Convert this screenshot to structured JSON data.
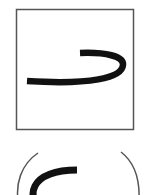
{
  "options": [
    {
      "shape": "square-frame",
      "glyph": "curved-stroke-hook-right",
      "stroke_color": "#111111",
      "frame_color": "#555555"
    },
    {
      "shape": "circle-frame",
      "glyph": "curved-stroke-c",
      "stroke_color": "#111111",
      "frame_color": "#555555"
    }
  ]
}
